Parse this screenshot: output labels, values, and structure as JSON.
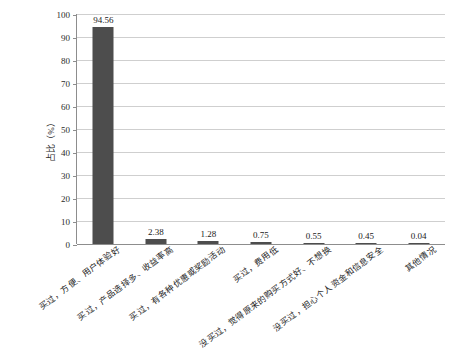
{
  "chart_data": {
    "type": "bar",
    "title": "",
    "xlabel": "",
    "ylabel": "占比（%）",
    "ylim": [
      0,
      100
    ],
    "ytick_step": 10,
    "yticks": [
      0,
      10,
      20,
      30,
      40,
      50,
      60,
      70,
      80,
      90,
      100
    ],
    "grid": true,
    "legend": "none",
    "bar_color": "#4d4d4d",
    "categories": [
      "买过，方便、用户体验好",
      "买过，产品选择多、收益率高",
      "买过，有各种优惠或奖励活动",
      "买过，费用低",
      "没买过，觉得原来的购买方式好、不想换",
      "没买过，担心个人资金和信息安全",
      "其他情况"
    ],
    "values": [
      94.56,
      2.38,
      1.28,
      0.75,
      0.55,
      0.45,
      0.04
    ],
    "value_labels": [
      "94.56",
      "2.38",
      "1.28",
      "0.75",
      "0.55",
      "0.45",
      "0.04"
    ]
  }
}
